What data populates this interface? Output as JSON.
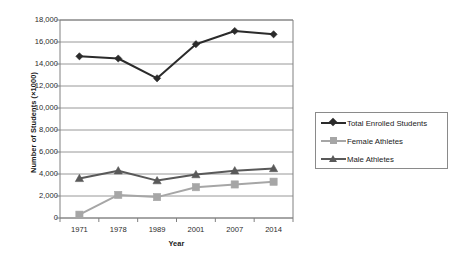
{
  "chart_data": {
    "type": "line",
    "title": "",
    "xlabel": "Year",
    "ylabel": "Number of Students (×1000)",
    "categories": [
      "1971",
      "1978",
      "1989",
      "2001",
      "2007",
      "2014"
    ],
    "ylim": [
      0,
      18000
    ],
    "ytick_labels": [
      "18,000",
      "16,000",
      "14,000",
      "12,000",
      "10,000",
      "8,000",
      "6,000",
      "4,000",
      "2,000",
      "0"
    ],
    "ytick_values": [
      18000,
      16000,
      14000,
      12000,
      10000,
      8000,
      6000,
      4000,
      2000,
      0
    ],
    "grid": "horizontal",
    "legend_position": "right",
    "series": [
      {
        "name": "Total Enrolled Students",
        "marker": "diamond",
        "color": "#2b2b2b",
        "values": [
          14700,
          14500,
          12700,
          15800,
          17000,
          16700
        ]
      },
      {
        "name": "Female Athletes",
        "marker": "square",
        "color": "#a6a6a6",
        "values": [
          300,
          2100,
          1900,
          2800,
          3050,
          3300
        ]
      },
      {
        "name": "Male Athletes",
        "marker": "triangle",
        "color": "#595959",
        "values": [
          3600,
          4300,
          3400,
          3950,
          4300,
          4500
        ]
      }
    ]
  },
  "colors": {
    "axis": "#808080",
    "gridline": "#8c8c8c",
    "plot_border": "#808080",
    "text": "#1a1a1a",
    "background": "#ffffff",
    "series_total": "#2b2b2b",
    "series_female": "#a6a6a6",
    "series_male": "#595959"
  }
}
